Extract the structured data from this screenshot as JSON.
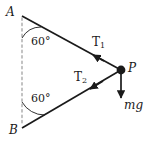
{
  "figure": {
    "type": "physics-free-body-diagram",
    "background_color": "#ffffff",
    "stroke_color": "#1a1a1a",
    "dashed_color": "#b3b3b3",
    "labels": {
      "vertex_a": "A",
      "vertex_b": "B",
      "point_p": "P",
      "tension_1": "T",
      "tension_1_sub": "1",
      "tension_2": "T",
      "tension_2_sub": "2",
      "weight": "mg",
      "angle_a": "60°",
      "angle_b": "60°"
    },
    "geometry": {
      "a": {
        "x": 22,
        "y": 16
      },
      "b": {
        "x": 22,
        "y": 128
      },
      "p": {
        "x": 121,
        "y": 70
      },
      "mg_tip": {
        "x": 121,
        "y": 101
      },
      "angle_a_degrees": 60,
      "angle_b_degrees": 60,
      "arc_radius_a": 22,
      "arc_radius_b": 26,
      "dashed_line_top": {
        "x": 22,
        "y": 18
      },
      "dashed_line_bottom": {
        "x": 22,
        "y": 126
      }
    }
  }
}
